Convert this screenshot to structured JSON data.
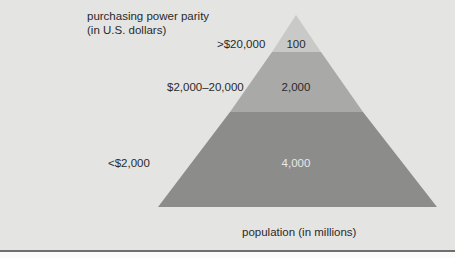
{
  "diagram": {
    "type": "pyramid",
    "y_axis_title": "purchasing power parity",
    "y_axis_subtitle": "(in U.S. dollars)",
    "x_axis_label": "population (in millions)",
    "tiers": [
      {
        "income_label": ">$20,000",
        "population": "100",
        "color": "#c9cac8"
      },
      {
        "income_label": "$2,000–20,000",
        "population": "2,000",
        "color": "#a9a9a8"
      },
      {
        "income_label": "<$2,000",
        "population": "4,000",
        "color": "#8c8c8b"
      }
    ],
    "background_color": "#e4e4e3"
  }
}
